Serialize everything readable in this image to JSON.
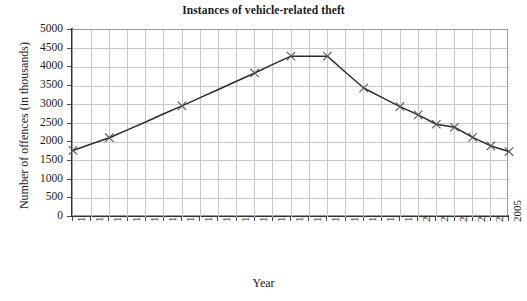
{
  "chart_data": {
    "type": "line",
    "title": "Instances of vehicle-related theft",
    "xlabel": "Year",
    "ylabel": "Number of offences (in thousands)",
    "xlim": [
      1981,
      2005
    ],
    "ylim": [
      0,
      5000
    ],
    "ytick_step": 500,
    "grid": true,
    "legend": "none",
    "marker": "x",
    "line_color": "#2b2b2b",
    "grid_color": "#c8c8c8",
    "x": [
      1981,
      1982,
      1983,
      1984,
      1985,
      1986,
      1987,
      1988,
      1989,
      1990,
      1991,
      1992,
      1993,
      1994,
      1995,
      1996,
      1997,
      1998,
      1999,
      2000,
      2001,
      2002,
      2003,
      2004,
      2005
    ],
    "xticklabels": [
      "1981",
      "1982",
      "1983",
      "1984",
      "1985",
      "1986",
      "1987",
      "1988",
      "1989",
      "1990",
      "1991",
      "1992",
      "1993",
      "1994",
      "1995",
      "1996",
      "1997",
      "1998",
      "1999",
      "2000",
      "2001",
      "2002",
      "2003",
      "2004",
      "2005"
    ],
    "yticklabels": [
      "0",
      "500",
      "1000",
      "1500",
      "2000",
      "2500",
      "3000",
      "3500",
      "4000",
      "4500",
      "5000"
    ],
    "yticks": [
      0,
      500,
      1000,
      1500,
      2000,
      2500,
      3000,
      3500,
      4000,
      4500,
      5000
    ],
    "values": [
      1780,
      1950,
      2120,
      2330,
      2540,
      2760,
      2970,
      3190,
      3410,
      3630,
      3850,
      4080,
      4300,
      4300,
      4300,
      3870,
      3450,
      3200,
      2950,
      2730,
      2480,
      2400,
      2130,
      1900,
      1750
    ],
    "markers": [
      {
        "x": 1981,
        "y": 1780
      },
      {
        "x": 1983,
        "y": 2120
      },
      {
        "x": 1987,
        "y": 2970
      },
      {
        "x": 1991,
        "y": 3850
      },
      {
        "x": 1993,
        "y": 4300
      },
      {
        "x": 1995,
        "y": 4300
      },
      {
        "x": 1997,
        "y": 3450
      },
      {
        "x": 1999,
        "y": 2950
      },
      {
        "x": 2000,
        "y": 2730
      },
      {
        "x": 2001,
        "y": 2480
      },
      {
        "x": 2002,
        "y": 2400
      },
      {
        "x": 2003,
        "y": 2130
      },
      {
        "x": 2004,
        "y": 1900
      },
      {
        "x": 2005,
        "y": 1750
      }
    ]
  }
}
